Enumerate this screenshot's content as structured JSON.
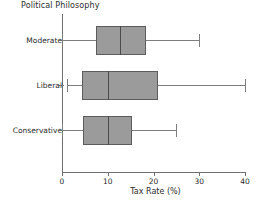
{
  "chart_data": {
    "type": "box",
    "title": "Political Philosophy",
    "xlabel": "Tax Rate (%)",
    "ylabel": "",
    "orientation": "horizontal",
    "xlim": [
      0,
      40
    ],
    "xticks": [
      0,
      10,
      20,
      30,
      40
    ],
    "xticklabels": [
      "0",
      "10",
      "20",
      "30",
      "40"
    ],
    "grid": false,
    "legend": false,
    "categories": [
      "Moderate",
      "Liberal",
      "Conservative"
    ],
    "boxes": [
      {
        "category": "Moderate",
        "whisker_low": 0.0,
        "q1": 7.5,
        "median": 12.6,
        "q3": 18.3,
        "whisker_high": 30.0
      },
      {
        "category": "Liberal",
        "whisker_low": 1.0,
        "q1": 4.4,
        "median": 10.0,
        "q3": 21.0,
        "whisker_high": 40.0
      },
      {
        "category": "Conservative",
        "whisker_low": 0.0,
        "q1": 4.6,
        "median": 10.0,
        "q3": 15.3,
        "whisker_high": 25.0
      }
    ],
    "colors": {
      "box_fill": "#9b9b9b",
      "box_edge": "#5c5c5c",
      "median": "#4a4a4a",
      "whisker": "#7d7d7d",
      "axis": "#6f6f6f",
      "text": "#2b2b2b",
      "background": "#ffffff"
    }
  }
}
